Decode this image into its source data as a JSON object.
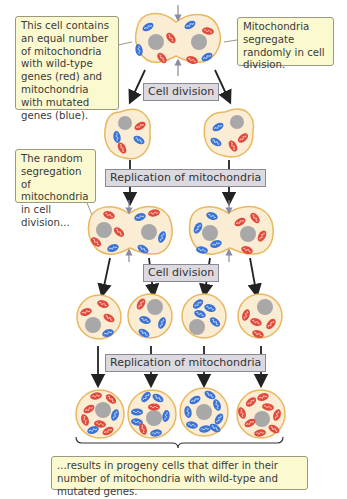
{
  "callouts": {
    "top_left": "This cell contains an equal number of mitochondria with wild-type genes (red) and mitochondria with mutated genes (blue).",
    "top_right": "Mitochondria segregate randomly in cell division.",
    "middle_left": "The random segregation of mitochondria in cell division...",
    "bottom": "...results in progeny cells that differ in their number of mitochondria with wild-type and mutated genes."
  },
  "labels": {
    "cell_division_1": "Cell division",
    "replication_1": "Replication of mitochondria",
    "cell_division_2": "Cell division",
    "replication_2": "Replication of mitochondria"
  },
  "colors": {
    "wild_type": "#e04a3c",
    "mutated": "#3b73d4",
    "cell_fill": "#fbecd4",
    "cell_border": "#e8b860",
    "nucleus": "#a8a8a8"
  }
}
